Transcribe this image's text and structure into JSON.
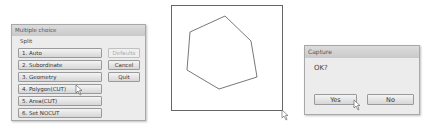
{
  "multiple_choice": {
    "title": "Multiple choice",
    "prompt": "Split",
    "options": [
      {
        "label": "1. Auto"
      },
      {
        "label": "2. Subordinate"
      },
      {
        "label": "3. Geometry"
      },
      {
        "label": "4. Polygon(CUT)"
      },
      {
        "label": "5. Area(CUT)"
      },
      {
        "label": "6. Set NOCUT"
      }
    ],
    "side_buttons": {
      "defaults": "Defaults",
      "cancel": "Cancel",
      "quit": "Quit"
    }
  },
  "canvas": {
    "polygon_points": "53,10 18,26 15,64 47,83 85,71 79,35",
    "stroke_color": "#555555"
  },
  "capture": {
    "title": "Capture",
    "message": "OK?",
    "yes_label": "Yes",
    "no_label": "No"
  }
}
